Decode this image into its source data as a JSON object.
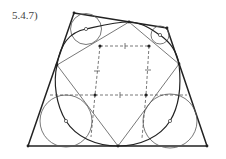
{
  "figure": {
    "label": "5.4.7)"
  },
  "colors": {
    "stroke_dark": "#222222",
    "stroke_light": "#555555",
    "dashed": "#555555",
    "background": "#ffffff"
  },
  "quadrilateral": {
    "vertices": [
      [
        74,
        13
      ],
      [
        167,
        28
      ],
      [
        207,
        146
      ],
      [
        28,
        146
      ]
    ]
  },
  "tangent_points": {
    "top": [
      129,
      22
    ],
    "right": [
      179,
      64
    ],
    "bottom": [
      118,
      146
    ],
    "left": [
      57,
      65
    ]
  },
  "circles": [
    {
      "name": "top-left",
      "cx": 86,
      "cy": 29,
      "r": 15.5
    },
    {
      "name": "top-right",
      "cx": 160,
      "cy": 35,
      "r": 9
    },
    {
      "name": "bottom-left",
      "cx": 66,
      "cy": 121,
      "r": 26
    },
    {
      "name": "bottom-right",
      "cx": 170,
      "cy": 121,
      "r": 27
    }
  ],
  "dashed_square": {
    "vertices": [
      [
        100,
        46
      ],
      [
        149,
        46
      ],
      [
        146,
        95
      ],
      [
        95,
        95
      ]
    ]
  }
}
